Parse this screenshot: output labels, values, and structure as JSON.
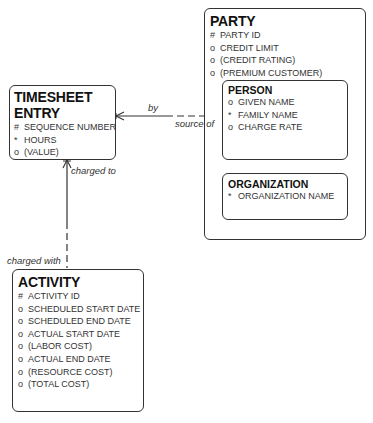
{
  "entities": {
    "timesheet": {
      "name": "TIMESHEET ENTRY",
      "attributes": [
        {
          "mark": "#",
          "label": "SEQUENCE NUMBER"
        },
        {
          "mark": "*",
          "label": "HOURS"
        },
        {
          "mark": "o",
          "label": "(VALUE)"
        }
      ]
    },
    "party": {
      "name": "PARTY",
      "attributes": [
        {
          "mark": "#",
          "label": "PARTY ID"
        },
        {
          "mark": "o",
          "label": "CREDIT LIMIT"
        },
        {
          "mark": "o",
          "label": "(CREDIT RATING)"
        },
        {
          "mark": "o",
          "label": "(PREMIUM CUSTOMER)"
        }
      ],
      "subtypes": {
        "person": {
          "name": "PERSON",
          "attributes": [
            {
              "mark": "o",
              "label": "GIVEN NAME"
            },
            {
              "mark": "*",
              "label": "FAMILY NAME"
            },
            {
              "mark": "o",
              "label": "CHARGE RATE"
            }
          ]
        },
        "organization": {
          "name": "ORGANIZATION",
          "attributes": [
            {
              "mark": "*",
              "label": "ORGANIZATION NAME"
            }
          ]
        }
      }
    },
    "activity": {
      "name": "ACTIVITY",
      "attributes": [
        {
          "mark": "#",
          "label": "ACTIVITY ID"
        },
        {
          "mark": "o",
          "label": "SCHEDULED START DATE"
        },
        {
          "mark": "o",
          "label": "SCHEDULED END DATE"
        },
        {
          "mark": "o",
          "label": "ACTUAL START DATE"
        },
        {
          "mark": "o",
          "label": "(LABOR COST)"
        },
        {
          "mark": "o",
          "label": "ACTUAL END DATE"
        },
        {
          "mark": "o",
          "label": "(RESOURCE COST)"
        },
        {
          "mark": "o",
          "label": "(TOTAL COST)"
        }
      ]
    }
  },
  "relationships": {
    "timesheet_person": {
      "from_label": "by",
      "to_label": "source of"
    },
    "timesheet_activity": {
      "from_label": "charged to",
      "to_label": "charged with"
    }
  }
}
